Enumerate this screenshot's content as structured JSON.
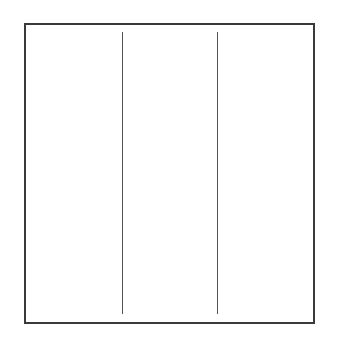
{
  "diagram": {
    "shape": "rectangle",
    "border_color": "#3a3a3a",
    "divider_color": "#555555",
    "dividers": [
      {
        "x": 122
      },
      {
        "x": 217
      }
    ],
    "columns": 3
  }
}
